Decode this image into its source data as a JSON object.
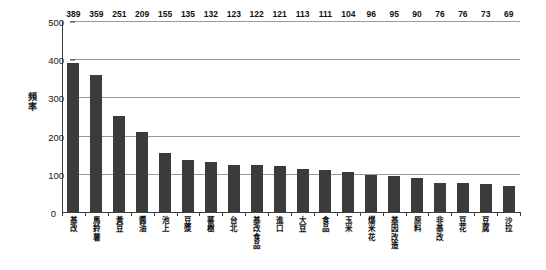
{
  "chart_data": {
    "type": "bar",
    "title": "",
    "xlabel": "",
    "ylabel": "頻率",
    "ylim": [
      0,
      500
    ],
    "yticks": [
      0,
      100,
      200,
      300,
      400,
      500
    ],
    "grid": true,
    "legend": null,
    "orientation": "vertical",
    "bar_color": "#3b3b3b",
    "grid_color": "#9a9a9a",
    "axis_color": "#3f3f3f",
    "categories": [
      "基改",
      "馬鈴薯",
      "黃豆",
      "醬油",
      "池上",
      "豆漿",
      "蕃樹",
      "台北",
      "基改食品",
      "進口",
      "大豆",
      "食品",
      "玉米",
      "爆米花",
      "基因改造",
      "原料",
      "非基改",
      "豆花",
      "豆腐",
      "沙拉"
    ],
    "values": [
      389,
      359,
      251,
      209,
      155,
      135,
      132,
      123,
      122,
      121,
      113,
      111,
      104,
      96,
      95,
      90,
      76,
      76,
      73,
      69
    ]
  }
}
